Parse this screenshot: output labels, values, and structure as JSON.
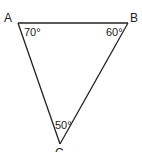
{
  "diagram": {
    "type": "triangle",
    "vertices": [
      {
        "name": "A",
        "x": 18,
        "y": 23,
        "angle": "70°"
      },
      {
        "name": "B",
        "x": 128,
        "y": 23,
        "angle": "60°"
      },
      {
        "name": "C",
        "x": 60,
        "y": 144,
        "angle": "50°"
      }
    ],
    "labels": {
      "A": "A",
      "B": "B",
      "C": "C",
      "angle_A": "70°",
      "angle_B": "60°",
      "angle_C": "50°"
    },
    "colors": {
      "stroke": "#222222",
      "background": "#ffffff"
    }
  }
}
